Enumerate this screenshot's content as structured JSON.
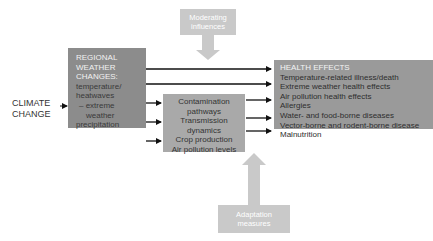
{
  "diagram": {
    "climate_change": {
      "line1": "CLIMATE",
      "line2": "CHANGE"
    },
    "moderating": {
      "line1": "Moderating",
      "line2": "influences"
    },
    "regional": {
      "heading": [
        "REGIONAL",
        "WEATHER",
        "CHANGES:"
      ],
      "items": [
        "temperature/",
        "heatwaves",
        "– extreme",
        "weather",
        "precipitation"
      ]
    },
    "middle": {
      "items": [
        "Contamination",
        "pathways",
        "Transmission",
        "dynamics",
        "Crop production",
        "Air pollution levels"
      ]
    },
    "health": {
      "heading": "HEALTH EFFECTS",
      "items": [
        "Temperature-related illness/death",
        "Extreme weather health effects",
        "Air pollution health effects",
        "Allergies",
        "Water- and food-borne diseases",
        "Vector-borne and rodent-borne disease",
        "Malnutrition"
      ]
    },
    "adaptation": {
      "line1": "Adaptation",
      "line2": "measures"
    },
    "colors": {
      "regional_box": "#8c8c8c",
      "middle_box": "#a9a9a9",
      "health_box": "#9a9a9a",
      "influence_box": "#c9c9c9",
      "arrow": "#111111"
    }
  }
}
